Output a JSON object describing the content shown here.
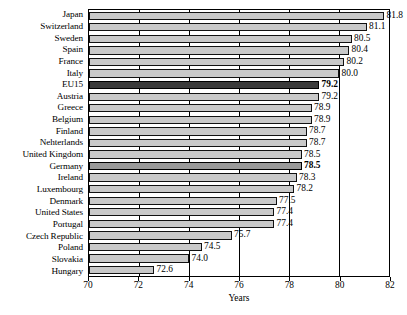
{
  "chart_data": {
    "type": "bar",
    "orientation": "horizontal",
    "title": "",
    "xlabel": "Years",
    "ylabel": "",
    "xlim": [
      70,
      82
    ],
    "xticks": [
      70,
      72,
      74,
      76,
      78,
      80,
      82
    ],
    "grid": true,
    "legend": null,
    "categories": [
      "Japan",
      "Switzerland",
      "Sweden",
      "Spain",
      "France",
      "Italy",
      "EU15",
      "Austria",
      "Greece",
      "Belgium",
      "Finland",
      "Nehterlands",
      "United Kingdom",
      "Germany",
      "Ireland",
      "Luxembourg",
      "Denmark",
      "United States",
      "Portugal",
      "Czech Republic",
      "Poland",
      "Slovakia",
      "Hungary"
    ],
    "values": [
      81.8,
      81.1,
      80.5,
      80.4,
      80.2,
      80.0,
      79.2,
      79.2,
      78.9,
      78.9,
      78.7,
      78.7,
      78.5,
      78.5,
      78.3,
      78.2,
      77.5,
      77.4,
      77.4,
      75.7,
      74.5,
      74.0,
      72.6
    ],
    "value_labels": [
      "81.8",
      "81.1",
      "80.5",
      "80.4",
      "80.2",
      "80.0",
      "79.2",
      "79.2",
      "78.9",
      "78.9",
      "78.7",
      "78.7",
      "78.5",
      "78.5",
      "78.3",
      "78.2",
      "77.5",
      "77.4",
      "77.4",
      "75.7",
      "74.5",
      "74.0",
      "72.6"
    ],
    "highlight": {
      "EU15": "dark",
      "Germany": "mid"
    },
    "bold_labels": [
      "EU15",
      "Germany"
    ],
    "colors": {
      "bar": "#c9c9c9",
      "bar_highlight_dark": "#3b3b3b",
      "bar_highlight_mid": "#9a9a9a",
      "bar_border": "#111111",
      "axis": "#000000",
      "background": "#ffffff",
      "text": "#000000"
    }
  }
}
